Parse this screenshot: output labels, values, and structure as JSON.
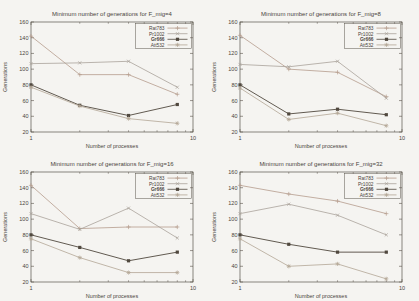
{
  "page": {
    "background": "#f5f4f1",
    "text_color": "#4a443c",
    "axis_color": "#5a544c"
  },
  "chart_data": [
    {
      "type": "line",
      "title": "Minimum number of generations for F_mig=4",
      "xlabel": "Number of processes",
      "ylabel": "Generations",
      "xscale": "log",
      "xlim": [
        1,
        10
      ],
      "ylim": [
        20,
        160
      ],
      "xticks": [
        1,
        10
      ],
      "xminorticks": [
        2,
        3,
        4,
        5,
        6,
        7,
        8,
        9
      ],
      "yticks": [
        20,
        40,
        60,
        80,
        100,
        120,
        140,
        160
      ],
      "legend_position": "top-right",
      "x": [
        1,
        2,
        4,
        8
      ],
      "series": [
        {
          "name": "Rat783",
          "values": [
            142,
            93,
            93,
            68
          ],
          "color": "#b59c8d",
          "marker": "plus"
        },
        {
          "name": "Pr1002",
          "values": [
            107,
            108,
            110,
            77
          ],
          "color": "#a9a29a",
          "marker": "cross"
        },
        {
          "name": "Gr666",
          "values": [
            80,
            54,
            41,
            55
          ],
          "color": "#50483e",
          "marker": "square"
        },
        {
          "name": "Att532",
          "values": [
            77,
            53,
            37,
            31
          ],
          "color": "#b3a695",
          "marker": "asterisk"
        }
      ]
    },
    {
      "type": "line",
      "title": "Minimum number of generations for F_mig=8",
      "xlabel": "Number of processes",
      "ylabel": "Generations",
      "xscale": "log",
      "xlim": [
        1,
        10
      ],
      "ylim": [
        20,
        160
      ],
      "xticks": [
        1,
        10
      ],
      "xminorticks": [
        2,
        3,
        4,
        5,
        6,
        7,
        8,
        9
      ],
      "yticks": [
        20,
        40,
        60,
        80,
        100,
        120,
        140,
        160
      ],
      "legend_position": "top-right",
      "x": [
        1,
        2,
        4,
        8
      ],
      "series": [
        {
          "name": "Rat783",
          "values": [
            143,
            100,
            96,
            65
          ],
          "color": "#b59c8d",
          "marker": "plus"
        },
        {
          "name": "Pr1002",
          "values": [
            106,
            103,
            110,
            63
          ],
          "color": "#a9a29a",
          "marker": "cross"
        },
        {
          "name": "Gr666",
          "values": [
            80,
            43,
            49,
            42
          ],
          "color": "#50483e",
          "marker": "square"
        },
        {
          "name": "Att532",
          "values": [
            76,
            36,
            44,
            28
          ],
          "color": "#b3a695",
          "marker": "asterisk"
        }
      ]
    },
    {
      "type": "line",
      "title": "Minimum number of generations for F_mig=16",
      "xlabel": "Number of processes",
      "ylabel": "Generations",
      "xscale": "log",
      "xlim": [
        1,
        10
      ],
      "ylim": [
        20,
        160
      ],
      "xticks": [
        1,
        10
      ],
      "xminorticks": [
        2,
        3,
        4,
        5,
        6,
        7,
        8,
        9
      ],
      "yticks": [
        20,
        40,
        60,
        80,
        100,
        120,
        140,
        160
      ],
      "legend_position": "top-right",
      "x": [
        1,
        2,
        4,
        8
      ],
      "series": [
        {
          "name": "Rat783",
          "values": [
            143,
            88,
            90,
            90
          ],
          "color": "#b59c8d",
          "marker": "plus"
        },
        {
          "name": "Pr1002",
          "values": [
            107,
            87,
            114,
            76
          ],
          "color": "#a9a29a",
          "marker": "cross"
        },
        {
          "name": "Gr666",
          "values": [
            80,
            64,
            47,
            58
          ],
          "color": "#50483e",
          "marker": "square"
        },
        {
          "name": "Att532",
          "values": [
            75,
            51,
            32,
            32
          ],
          "color": "#b3a695",
          "marker": "asterisk"
        }
      ]
    },
    {
      "type": "line",
      "title": "Minimum number of generations for F_mig=32",
      "xlabel": "Number of processes",
      "ylabel": "Generations",
      "xscale": "log",
      "xlim": [
        1,
        10
      ],
      "ylim": [
        20,
        160
      ],
      "xticks": [
        1,
        10
      ],
      "xminorticks": [
        2,
        3,
        4,
        5,
        6,
        7,
        8,
        9
      ],
      "yticks": [
        20,
        40,
        60,
        80,
        100,
        120,
        140,
        160
      ],
      "legend_position": "top-right",
      "x": [
        1,
        2,
        4,
        8
      ],
      "series": [
        {
          "name": "Rat783",
          "values": [
            143,
            132,
            123,
            107
          ],
          "color": "#b59c8d",
          "marker": "plus"
        },
        {
          "name": "Pr1002",
          "values": [
            107,
            119,
            105,
            80
          ],
          "color": "#a9a29a",
          "marker": "cross"
        },
        {
          "name": "Gr666",
          "values": [
            80,
            68,
            58,
            58
          ],
          "color": "#50483e",
          "marker": "square"
        },
        {
          "name": "Att532",
          "values": [
            75,
            40,
            43,
            24
          ],
          "color": "#b3a695",
          "marker": "asterisk"
        }
      ]
    }
  ]
}
